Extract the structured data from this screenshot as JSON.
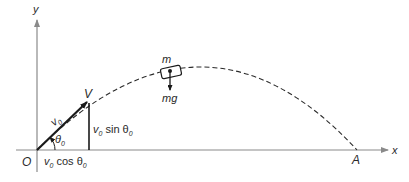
{
  "diagram": {
    "type": "projectile-motion",
    "axes": {
      "x_label": "x",
      "y_label": "y",
      "origin_label": "O"
    },
    "labels": {
      "velocity_vector": "V",
      "initial_speed": "v",
      "initial_speed_sub": "0",
      "angle": "θ",
      "angle_sub": "0",
      "vertical_component_prefix": "v",
      "vertical_component_sub": "0",
      "vertical_component_func": " sin θ",
      "vertical_component_func_sub": "0",
      "horizontal_component_prefix": "v",
      "horizontal_component_sub": "0",
      "horizontal_component_func": " cos θ",
      "horizontal_component_func_sub": "0",
      "mass": "m",
      "weight": "mg",
      "landing_point": "A"
    },
    "colors": {
      "line": "#2a2a2a",
      "axis": "#8a8a8a",
      "background": "#ffffff"
    }
  }
}
